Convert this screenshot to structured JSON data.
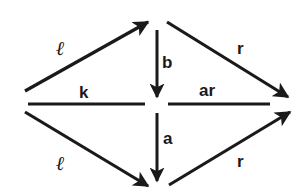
{
  "diagram": {
    "type": "commutative-diagram",
    "stroke_color": "#1a1a1a",
    "background": "#ffffff",
    "arrows": [
      {
        "id": "upper-left",
        "label": "ℓ",
        "from": "left",
        "to": "top"
      },
      {
        "id": "upper-right",
        "label": "r",
        "from": "top",
        "to": "right"
      },
      {
        "id": "vertical-top",
        "label": "b",
        "from": "top",
        "to": "center"
      },
      {
        "id": "vertical-bottom",
        "label": "a",
        "from": "center",
        "to": "bottom"
      },
      {
        "id": "lower-left",
        "label": "ℓ",
        "from": "left",
        "to": "bottom"
      },
      {
        "id": "lower-right",
        "label": "r",
        "from": "bottom",
        "to": "right"
      }
    ],
    "lines": [
      {
        "id": "horizontal-left",
        "label": "k"
      },
      {
        "id": "horizontal-right",
        "label": "ar"
      }
    ],
    "labels": {
      "upper_left": "ℓ",
      "upper_right": "r",
      "b": "b",
      "k": "k",
      "ar": "ar",
      "a": "a",
      "lower_left": "ℓ",
      "lower_right": "r"
    }
  }
}
